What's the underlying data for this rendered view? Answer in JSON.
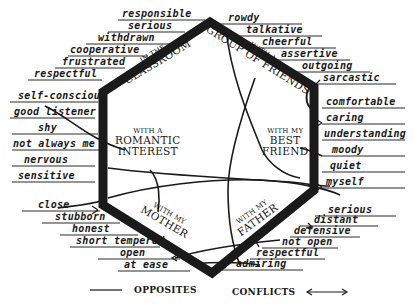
{
  "diagram": {
    "type": "hexagon-personality-map",
    "colors": {
      "ink": "#1a1a1a",
      "background": "#ffffff"
    },
    "contexts": [
      {
        "id": "classroom",
        "line1": "IN THE",
        "line2": "CLASSROOM"
      },
      {
        "id": "friends",
        "line1": "WITH A",
        "line2": "GROUP OF FRIENDS"
      },
      {
        "id": "romantic",
        "line1": "WITH A",
        "line2": "ROMANTIC",
        "line3": "INTEREST"
      },
      {
        "id": "best-friend",
        "line1": "WITH MY",
        "line2": "BEST",
        "line3": "FRIEND"
      },
      {
        "id": "mother",
        "line1": "WITH MY",
        "line2": "MOTHER"
      },
      {
        "id": "father",
        "line1": "WITH MY",
        "line2": "FATHER"
      }
    ],
    "traits": {
      "classroom": [
        "responsible",
        "serious",
        "withdrawn",
        "cooperative",
        "frustrated",
        "respectful"
      ],
      "friends": [
        "rowdy",
        "talkative",
        "cheerful",
        "assertive",
        "outgoing",
        "sarcastic"
      ],
      "romantic": [
        "self-conscious",
        "good listener",
        "shy",
        "not always me",
        "nervous",
        "sensitive"
      ],
      "best_friend": [
        "comfortable",
        "caring",
        "understanding",
        "moody",
        "quiet",
        "myself"
      ],
      "mother": [
        "close",
        "stubborn",
        "honest",
        "short tempered",
        "open",
        "at ease"
      ],
      "father": [
        "serious",
        "distant",
        "defensive",
        "not open",
        "respectful",
        "admiring"
      ]
    },
    "legend": {
      "opposites_label": "OPPOSITES",
      "conflicts_label": "CONFLICTS"
    }
  }
}
